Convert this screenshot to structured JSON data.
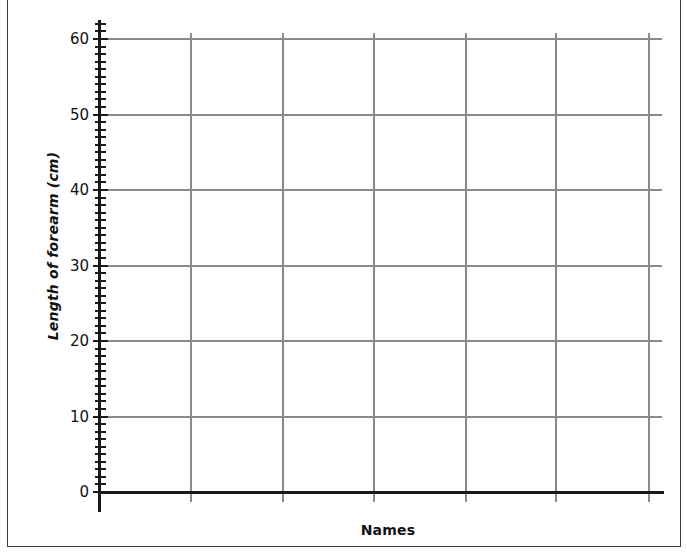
{
  "page": {
    "background_color": "#ffffff",
    "border_color": "#3c3c3c"
  },
  "chart_data": {
    "type": "bar",
    "title": "",
    "subtitle": "",
    "xlabel": "Names",
    "ylabel": "Length of forearm (cm)",
    "categories": [],
    "values": [],
    "series": [],
    "annotations": [],
    "legend": {
      "entries": [],
      "position": "none"
    },
    "grid": {
      "enabled": true,
      "color": "#8a8a8a",
      "horizontal_lines_at": [
        0,
        10,
        20,
        30,
        40,
        50,
        60
      ],
      "vertical_lines_count": 6
    },
    "yaxis": {
      "label": "Length of forearm (cm)",
      "ylim": [
        0,
        60
      ],
      "major_tick_interval": 10,
      "minor_tick_interval": 1,
      "tick_labels": [
        "60",
        "50",
        "40",
        "30",
        "20",
        "10",
        "0"
      ],
      "tick_values": [
        60,
        50,
        40,
        30,
        20,
        10,
        0
      ],
      "axis_color": "#1a1a1a"
    },
    "xaxis": {
      "label": "Names",
      "tick_labels": [],
      "axis_color": "#1a1a1a"
    },
    "note": "Blank worksheet grid — no data plotted"
  }
}
